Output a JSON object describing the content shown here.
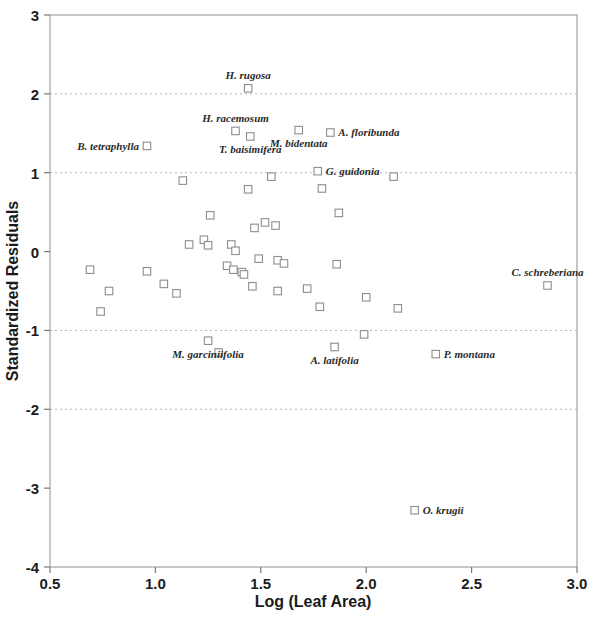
{
  "chart_data": {
    "type": "scatter",
    "title": "",
    "xlabel": "Log (Leaf Area)",
    "ylabel": "Standardized Residuals",
    "xlim": [
      0.5,
      3.0
    ],
    "ylim": [
      -4,
      3
    ],
    "xticks": [
      "0.5",
      "1.0",
      "1.5",
      "2.0",
      "2.5",
      "3.0"
    ],
    "xtick_values": [
      0.5,
      1.0,
      1.5,
      2.0,
      2.5,
      3.0
    ],
    "yticks": [
      "3",
      "2",
      "1",
      "0",
      "-1",
      "-2",
      "-3",
      "-4"
    ],
    "ytick_values": [
      3,
      2,
      1,
      0,
      -1,
      -2,
      -3,
      -4
    ],
    "grid": "horizontal dotted at y = 2, 1, -1, -2",
    "gridline_values": [
      2,
      1,
      -1,
      -2
    ],
    "legend": "none",
    "marker_style": "open square",
    "points": [
      {
        "x": 0.69,
        "y": -0.23,
        "label": null
      },
      {
        "x": 0.78,
        "y": -0.5,
        "label": null
      },
      {
        "x": 0.74,
        "y": -0.76,
        "label": null
      },
      {
        "x": 0.96,
        "y": -0.25,
        "label": null
      },
      {
        "x": 0.96,
        "y": 1.34,
        "label": "B. tetraphylla",
        "label_pos": "left"
      },
      {
        "x": 1.13,
        "y": 0.9,
        "label": null
      },
      {
        "x": 1.16,
        "y": 0.09,
        "label": null
      },
      {
        "x": 1.04,
        "y": -0.41,
        "label": null
      },
      {
        "x": 1.1,
        "y": -0.53,
        "label": null
      },
      {
        "x": 1.25,
        "y": -1.13,
        "label": "M. garciniifolia",
        "label_pos": "below"
      },
      {
        "x": 1.3,
        "y": -1.28,
        "label": null
      },
      {
        "x": 1.23,
        "y": 0.15,
        "label": null
      },
      {
        "x": 1.25,
        "y": 0.08,
        "label": null
      },
      {
        "x": 1.26,
        "y": 0.46,
        "label": null
      },
      {
        "x": 1.34,
        "y": -0.18,
        "label": null
      },
      {
        "x": 1.36,
        "y": 0.09,
        "label": null
      },
      {
        "x": 1.38,
        "y": 0.01,
        "label": null
      },
      {
        "x": 1.37,
        "y": -0.23,
        "label": null
      },
      {
        "x": 1.41,
        "y": -0.26,
        "label": null
      },
      {
        "x": 1.42,
        "y": -0.29,
        "label": null
      },
      {
        "x": 1.38,
        "y": 1.53,
        "label": "H. racemosum",
        "label_pos": "above"
      },
      {
        "x": 1.45,
        "y": 1.46,
        "label": "T. baisimifera",
        "label_pos": "below"
      },
      {
        "x": 1.44,
        "y": 2.07,
        "label": "H. rugosa",
        "label_pos": "above"
      },
      {
        "x": 1.44,
        "y": 0.79,
        "label": null
      },
      {
        "x": 1.47,
        "y": 0.3,
        "label": null
      },
      {
        "x": 1.52,
        "y": 0.37,
        "label": null
      },
      {
        "x": 1.49,
        "y": -0.09,
        "label": null
      },
      {
        "x": 1.46,
        "y": -0.44,
        "label": null
      },
      {
        "x": 1.55,
        "y": 0.95,
        "label": null
      },
      {
        "x": 1.57,
        "y": 0.33,
        "label": null
      },
      {
        "x": 1.58,
        "y": -0.11,
        "label": null
      },
      {
        "x": 1.61,
        "y": -0.15,
        "label": null
      },
      {
        "x": 1.58,
        "y": -0.5,
        "label": null
      },
      {
        "x": 1.68,
        "y": 1.54,
        "label": "M. bidentata",
        "label_pos": "below"
      },
      {
        "x": 1.83,
        "y": 1.51,
        "label": "A. floribunda",
        "label_pos": "right"
      },
      {
        "x": 1.77,
        "y": 1.02,
        "label": "G. guidonia",
        "label_pos": "right"
      },
      {
        "x": 1.79,
        "y": 0.8,
        "label": null
      },
      {
        "x": 1.87,
        "y": 0.49,
        "label": null
      },
      {
        "x": 1.86,
        "y": -0.16,
        "label": null
      },
      {
        "x": 1.72,
        "y": -0.47,
        "label": null
      },
      {
        "x": 1.78,
        "y": -0.7,
        "label": null
      },
      {
        "x": 1.85,
        "y": -1.21,
        "label": "A. latifolia",
        "label_pos": "below"
      },
      {
        "x": 1.99,
        "y": -1.05,
        "label": null
      },
      {
        "x": 2.0,
        "y": -0.58,
        "label": null
      },
      {
        "x": 2.15,
        "y": -0.72,
        "label": null
      },
      {
        "x": 2.23,
        "y": -3.28,
        "label": "O. krugii",
        "label_pos": "right"
      },
      {
        "x": 2.33,
        "y": -1.3,
        "label": "P. montana",
        "label_pos": "right"
      },
      {
        "x": 2.13,
        "y": 0.95,
        "label": null
      },
      {
        "x": 2.86,
        "y": -0.43,
        "label": "C. schreberiana",
        "label_pos": "above"
      }
    ]
  },
  "axes": {
    "x_title": "Log (Leaf Area)",
    "y_title": "Standardized Residuals"
  }
}
